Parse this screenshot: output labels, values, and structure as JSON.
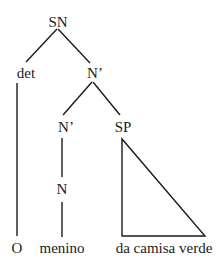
{
  "tree": {
    "nodes": {
      "root": "SN",
      "det": "det",
      "nbar_upper": "N’",
      "nbar_lower": "N’",
      "sp": "SP",
      "n": "N"
    },
    "leaves": {
      "det_leaf": "O",
      "n_leaf": "menino",
      "sp_leaf": "da camisa verde"
    },
    "edges": [
      [
        "SN",
        "det"
      ],
      [
        "SN",
        "N’"
      ],
      [
        "N’",
        "N’"
      ],
      [
        "N’",
        "SP"
      ],
      [
        "det",
        "O"
      ],
      [
        "N’",
        "N"
      ],
      [
        "N",
        "menino"
      ],
      [
        "SP",
        "da camisa verde (triangle)"
      ]
    ]
  }
}
